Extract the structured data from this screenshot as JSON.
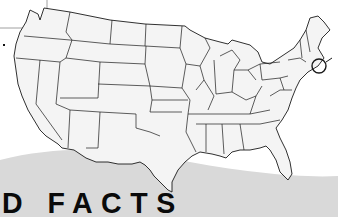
{
  "map": {
    "subject": "United States (contiguous 48 states) outline map",
    "highlight": {
      "shape": "circle",
      "region": "Connecticut / Rhode Island",
      "stroke_color": "#1a1a1a"
    },
    "callout_line": {
      "from": "left edge",
      "to": "Pacific Northwest"
    },
    "colors": {
      "land": "#f4f4f4",
      "border": "#1a1a1a",
      "swoosh": "#d6d6d6",
      "background": "#ffffff"
    }
  },
  "heading": {
    "text": "D FACTS"
  },
  "marker": {
    "dot_text": "."
  }
}
